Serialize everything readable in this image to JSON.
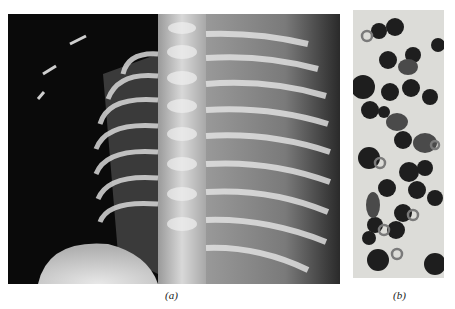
{
  "figure": {
    "panels": [
      {
        "id": "a",
        "label": "(a)",
        "content": "chest-xray"
      },
      {
        "id": "b",
        "label": "(b)",
        "content": "blood-smear-micrograph"
      }
    ]
  },
  "colors": {
    "xray_background": "#0a0a0a",
    "bone": "#e8e8e8",
    "smear_background": "#dcdcd8",
    "cell_dark": "#222222"
  }
}
